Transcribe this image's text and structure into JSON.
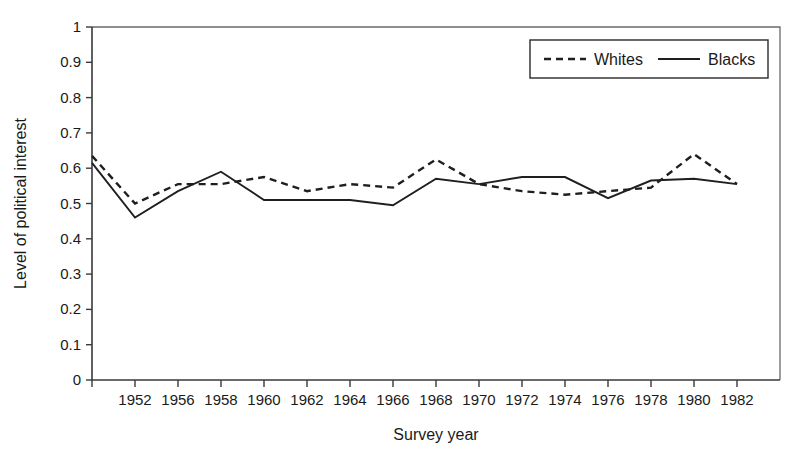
{
  "chart_data": {
    "type": "line",
    "title": "",
    "xlabel": "Survey year",
    "ylabel": "Level of political interest",
    "xlim": [
      1948,
      1984
    ],
    "ylim": [
      0,
      1
    ],
    "grid": false,
    "legend_position": "top-right",
    "x": [
      1948,
      1952,
      1956,
      1958,
      1960,
      1962,
      1964,
      1966,
      1968,
      1970,
      1972,
      1974,
      1976,
      1978,
      1980,
      1982
    ],
    "xtick_labels": [
      "",
      "1952",
      "1956",
      "1958",
      "1960",
      "1962",
      "1964",
      "1966",
      "1968",
      "1970",
      "1972",
      "1974",
      "1976",
      "1978",
      "1980",
      "1982"
    ],
    "ytick_labels": [
      "0",
      "0.1",
      "0.2",
      "0.3",
      "0.4",
      "0.5",
      "0.6",
      "0.7",
      "0.8",
      "0.9",
      "1"
    ],
    "ytick_values": [
      0,
      0.1,
      0.2,
      0.3,
      0.4,
      0.5,
      0.6,
      0.7,
      0.8,
      0.9,
      1
    ],
    "series": [
      {
        "name": "Whites",
        "style": "dashed",
        "color": "#1f1f1f",
        "values": [
          0.635,
          0.5,
          0.555,
          0.555,
          0.575,
          0.535,
          0.555,
          0.545,
          0.625,
          0.555,
          0.535,
          0.525,
          0.535,
          0.545,
          0.64,
          0.555
        ]
      },
      {
        "name": "Blacks",
        "style": "solid",
        "color": "#1f1f1f",
        "values": [
          0.615,
          0.46,
          0.535,
          0.59,
          0.51,
          0.51,
          0.51,
          0.495,
          0.57,
          0.555,
          0.575,
          0.575,
          0.515,
          0.565,
          0.57,
          0.555
        ]
      }
    ]
  },
  "legend": {
    "entries": [
      {
        "label": "Whites",
        "style": "dashed"
      },
      {
        "label": "Blacks",
        "style": "solid"
      }
    ]
  },
  "colors": {
    "line": "#1f1f1f",
    "axis": "#3a3a3a",
    "frame": "#6a6a6a",
    "text": "#1a1a1a",
    "background": "#ffffff"
  }
}
